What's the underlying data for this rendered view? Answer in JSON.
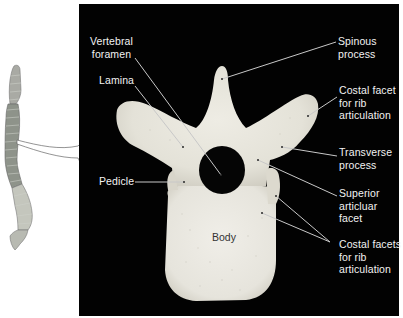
{
  "figure": {
    "background_color": "#ffffff",
    "panel_color": "#020202",
    "bone_color": "#e8e6dc",
    "label_color": "#f2f2f2",
    "leader_line_color": "#c8c8c8"
  },
  "inset": {
    "subject": "vertebral column (lateral view)",
    "callout": "arrow pointing to thoracic vertebra"
  },
  "labels": {
    "vertebral_foramen": "Vertebral\nforamen",
    "lamina": "Lamina",
    "pedicle": "Pedicle",
    "spinous_process": "Spinous\nprocess",
    "costal_facet": "Costal facet\nfor rib\narticulation",
    "transverse_process": "Transverse\nprocess",
    "superior_articular_facet": "Superior\narticluar\nfacet",
    "costal_facets": "Costal facets\nfor rib\narticulation",
    "body": "Body"
  }
}
